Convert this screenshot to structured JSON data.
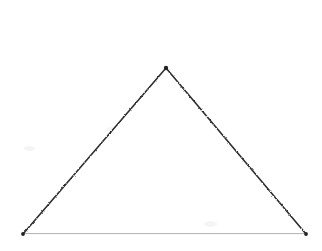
{
  "canvas": {
    "width": 322,
    "height": 251,
    "background_color": "#ffffff",
    "description": "Scanned line drawing of a single isosceles triangle on a blank white page"
  },
  "figure": {
    "name": "triangle",
    "shape_type": "triangle",
    "classification": "isosceles",
    "fill": "none",
    "vertices": [
      {
        "label": "apex",
        "x": 166,
        "y": 68
      },
      {
        "label": "bottom-right",
        "x": 306,
        "y": 234
      },
      {
        "label": "bottom-left",
        "x": 23,
        "y": 234
      }
    ],
    "edges": [
      {
        "label": "left-edge",
        "from": "bottom-left",
        "to": "apex",
        "x1": 23,
        "y1": 234,
        "x2": 166,
        "y2": 68,
        "color": "#2e2e2e",
        "width": 1.6,
        "style": "dotted-scan"
      },
      {
        "label": "right-edge",
        "from": "apex",
        "to": "bottom-right",
        "x1": 166,
        "y1": 68,
        "x2": 306,
        "y2": 234,
        "color": "#2e2e2e",
        "width": 1.6,
        "style": "dotted-scan"
      },
      {
        "label": "base-edge",
        "from": "bottom-left",
        "to": "bottom-right",
        "x1": 23,
        "y1": 234,
        "x2": 306,
        "y2": 234,
        "color": "#8d8d8d",
        "width": 1.4,
        "style": "solid"
      }
    ],
    "vertex_dots": [
      {
        "label": "apex-dot",
        "cx": 166,
        "cy": 68,
        "r": 2.2,
        "color": "#222222"
      },
      {
        "label": "bottom-left-dot",
        "cx": 23,
        "cy": 234,
        "r": 1.9,
        "color": "#222222"
      },
      {
        "label": "bottom-right-dot",
        "cx": 306,
        "cy": 234,
        "r": 1.9,
        "color": "#222222"
      }
    ]
  },
  "scan_artifacts": [
    {
      "x": 24,
      "y": 146,
      "w": 11,
      "h": 5,
      "opacity": 0.045
    },
    {
      "x": 204,
      "y": 221,
      "w": 13,
      "h": 6,
      "opacity": 0.04
    },
    {
      "x": 106,
      "y": 127,
      "w": 8,
      "h": 4,
      "opacity": 0.035
    }
  ],
  "colors": {
    "page": "#ffffff",
    "stroke_dark": "#2e2e2e",
    "stroke_base": "#8d8d8d",
    "vertex": "#222222"
  },
  "labels": {
    "annotations": [],
    "axis_ticks": [],
    "legend": []
  }
}
